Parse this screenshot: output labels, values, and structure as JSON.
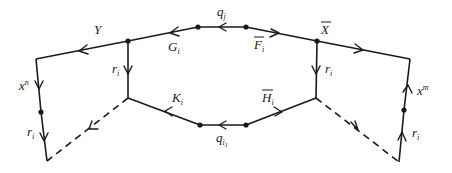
{
  "diagram": {
    "type": "graph-path-diagram",
    "labels": {
      "Y": "Y",
      "G_i": {
        "base": "G",
        "sub": "i"
      },
      "q_j": {
        "base": "q",
        "sub": "j"
      },
      "F_bar_i": {
        "base": "F",
        "sub": "i",
        "overline": true
      },
      "X_bar": {
        "base": "X",
        "overline": true
      },
      "r_i_left_inner": {
        "base": "r",
        "sub": "i"
      },
      "r_i_right_inner": {
        "base": "r",
        "sub": "i"
      },
      "K_i": {
        "base": "K",
        "sub": "i"
      },
      "H_bar_i": {
        "base": "H",
        "sub": "i",
        "overline": true
      },
      "q_i1": {
        "base": "q",
        "sub": "i",
        "subsub": "1"
      },
      "x_n": {
        "base": "x",
        "sup": "n"
      },
      "x_m": {
        "base": "x",
        "sup": "m"
      },
      "r_i_left_outer": {
        "base": "r",
        "sub": "i"
      },
      "r_i_right_outer": {
        "base": "r",
        "sub": "i"
      }
    },
    "nodes": [
      {
        "id": "L_top",
        "x": 36,
        "y": 59
      },
      {
        "id": "L_mid",
        "x": 41,
        "y": 112,
        "dot": true
      },
      {
        "id": "L_bot",
        "x": 47,
        "y": 161
      },
      {
        "id": "Y_junction",
        "x": 128,
        "y": 41,
        "dot": true
      },
      {
        "id": "L_inner",
        "x": 128,
        "y": 98
      },
      {
        "id": "top_left",
        "x": 198,
        "y": 27,
        "dot": true
      },
      {
        "id": "top_right",
        "x": 246,
        "y": 27,
        "dot": true
      },
      {
        "id": "X_junction",
        "x": 317,
        "y": 41,
        "dot": true
      },
      {
        "id": "R_inner",
        "x": 316,
        "y": 98
      },
      {
        "id": "R_top",
        "x": 410,
        "y": 59
      },
      {
        "id": "R_mid",
        "x": 404,
        "y": 110,
        "dot": true
      },
      {
        "id": "R_bot",
        "x": 399,
        "y": 162
      },
      {
        "id": "bot_left",
        "x": 200,
        "y": 125,
        "dot": true
      },
      {
        "id": "bot_right",
        "x": 246,
        "y": 125,
        "dot": true
      }
    ],
    "edges": [
      {
        "from": "top_left",
        "to": "Y_junction",
        "label": "G_i",
        "style": "solid"
      },
      {
        "from": "Y_junction",
        "to": "L_top",
        "label": "Y",
        "style": "solid"
      },
      {
        "from": "top_right",
        "to": "top_left",
        "label": "q_j",
        "style": "solid"
      },
      {
        "from": "top_right",
        "to": "X_junction",
        "label": "F_bar_i",
        "style": "solid"
      },
      {
        "from": "X_junction",
        "to": "R_top",
        "style": "solid"
      },
      {
        "from": "Y_junction",
        "to": "L_inner",
        "label": "r_i",
        "style": "solid"
      },
      {
        "from": "X_junction",
        "to": "R_inner",
        "label": "r_i",
        "style": "solid"
      },
      {
        "from": "L_top",
        "to": "L_mid",
        "label": "x_n",
        "style": "solid"
      },
      {
        "from": "L_mid",
        "to": "L_bot",
        "label": "r_i",
        "style": "solid"
      },
      {
        "from": "L_inner",
        "to": "L_bot",
        "style": "dashed"
      },
      {
        "from": "bot_left",
        "to": "L_inner",
        "label": "K_i",
        "style": "solid"
      },
      {
        "from": "bot_right",
        "to": "bot_left",
        "label": "q_i1",
        "style": "solid"
      },
      {
        "from": "bot_right",
        "to": "R_inner",
        "label": "H_bar_i",
        "style": "solid"
      },
      {
        "from": "R_inner",
        "to": "R_bot",
        "style": "dashed"
      },
      {
        "from": "R_bot",
        "to": "R_mid",
        "label": "r_i",
        "style": "solid"
      },
      {
        "from": "R_mid",
        "to": "R_top",
        "label": "x_m",
        "style": "solid"
      }
    ]
  }
}
